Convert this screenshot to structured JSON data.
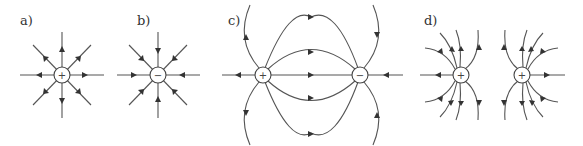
{
  "figure": {
    "panels": [
      {
        "label": "a)",
        "title": "Single positive charge",
        "charges": [
          {
            "sign": "+",
            "cx": 62,
            "cy": 75
          }
        ],
        "field": "radially outward"
      },
      {
        "label": "b)",
        "title": "Single negative charge",
        "charges": [
          {
            "sign": "−",
            "cx": 158,
            "cy": 75
          }
        ],
        "field": "radially inward"
      },
      {
        "label": "c)",
        "title": "Dipole (positive and negative)",
        "charges": [
          {
            "sign": "+",
            "cx": 263,
            "cy": 75
          },
          {
            "sign": "−",
            "cx": 360,
            "cy": 75
          }
        ],
        "field": "from + to −"
      },
      {
        "label": "d)",
        "title": "Two positive charges",
        "charges": [
          {
            "sign": "+",
            "cx": 461,
            "cy": 75
          },
          {
            "sign": "+",
            "cx": 522,
            "cy": 75
          }
        ],
        "field": "repelling outward"
      }
    ]
  },
  "colors": {
    "line": "#555555",
    "arrow": "#333333",
    "background": "#ffffff"
  }
}
